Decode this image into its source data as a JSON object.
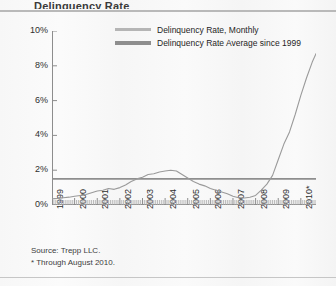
{
  "title": "Delinquency Rate",
  "legend": {
    "items": [
      {
        "label": "Delinquency Rate, Monthly",
        "color": "#b5b5b5",
        "style": "thin"
      },
      {
        "label": "Delinquency Rate Average since 1999",
        "color": "#8e8e8e",
        "style": "thick"
      }
    ]
  },
  "footnotes": {
    "source": "Source: Trepp LLC.",
    "note": "* Through August 2010."
  },
  "chart_data": {
    "type": "line",
    "title": "Delinquency Rate",
    "xlabel": "",
    "ylabel": "",
    "ylim": [
      0,
      10
    ],
    "yticks": [
      0,
      2,
      4,
      6,
      8,
      10
    ],
    "ytick_labels": [
      "0%",
      "2%",
      "4%",
      "6%",
      "8%",
      "10%"
    ],
    "xlim": [
      1999,
      2010.67
    ],
    "xticks": [
      1999,
      2000,
      2001,
      2002,
      2003,
      2004,
      2005,
      2006,
      2007,
      2008,
      2009,
      2010
    ],
    "xtick_labels": [
      "1999",
      "2000",
      "2001",
      "2002",
      "2003",
      "2004",
      "2005",
      "2006",
      "2007",
      "2008",
      "2009",
      "2010*"
    ],
    "grid": false,
    "legend_position": "top-center",
    "series": [
      {
        "name": "Delinquency Rate, Monthly",
        "color": "#9a9a9a",
        "x": [
          1999.0,
          1999.25,
          1999.5,
          1999.75,
          2000.0,
          2000.25,
          2000.5,
          2000.75,
          2001.0,
          2001.25,
          2001.5,
          2001.75,
          2002.0,
          2002.25,
          2002.5,
          2002.75,
          2003.0,
          2003.25,
          2003.5,
          2003.75,
          2004.0,
          2004.25,
          2004.5,
          2004.75,
          2005.0,
          2005.25,
          2005.5,
          2005.75,
          2006.0,
          2006.25,
          2006.5,
          2006.75,
          2007.0,
          2007.25,
          2007.5,
          2007.75,
          2008.0,
          2008.25,
          2008.5,
          2008.75,
          2009.0,
          2009.25,
          2009.5,
          2009.75,
          2010.0,
          2010.25,
          2010.5,
          2010.67
        ],
        "values": [
          0.35,
          0.38,
          0.42,
          0.45,
          0.5,
          0.55,
          0.6,
          0.7,
          0.8,
          0.85,
          0.95,
          0.9,
          1.0,
          1.15,
          1.35,
          1.5,
          1.6,
          1.75,
          1.8,
          1.9,
          1.95,
          2.0,
          1.95,
          1.75,
          1.55,
          1.35,
          1.2,
          1.1,
          0.95,
          0.85,
          0.75,
          0.65,
          0.5,
          0.42,
          0.4,
          0.45,
          0.55,
          0.85,
          1.2,
          1.7,
          2.6,
          3.5,
          4.2,
          5.2,
          6.3,
          7.3,
          8.2,
          8.7
        ]
      },
      {
        "name": "Delinquency Rate Average since 1999",
        "color": "#8e8e8e",
        "value": 1.5,
        "x": [
          1999.0,
          2010.67
        ],
        "values": [
          1.5,
          1.5
        ]
      }
    ]
  }
}
